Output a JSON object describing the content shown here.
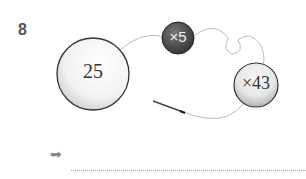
{
  "question": {
    "number": "8"
  },
  "diagram": {
    "big_bead": {
      "label": "25",
      "fill": "#f4f4f4"
    },
    "dark_bead": {
      "label": "×5",
      "fill": "#555555"
    },
    "medium_bead": {
      "label": "×43",
      "fill": "#e4e4e4"
    },
    "needle_icon": "needle",
    "thread_color": "#bbbbbb"
  },
  "answer": {
    "arrow_icon": "right-arrow",
    "arrow": "➡",
    "value": ""
  }
}
